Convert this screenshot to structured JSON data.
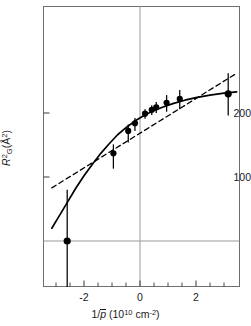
{
  "chart_data": {
    "type": "scatter",
    "title": "",
    "xlabel": "1/p̄ (10¹⁰ cm⁻²)",
    "ylabel": "R²G(Å²)",
    "xlim": [
      -3.2,
      3.5
    ],
    "ylim": [
      -40,
      300
    ],
    "grid": false,
    "zero_lines": {
      "vertical_x": 0,
      "horizontal_y": 0
    },
    "xticks_major": [
      -2,
      0,
      2
    ],
    "xticks_minor": [
      -3,
      -2.5,
      -1.5,
      -1,
      -0.5,
      0.5,
      1,
      1.5,
      2.5,
      3
    ],
    "xtick_labels": [
      "-2",
      "0",
      "2"
    ],
    "yticks": [
      100,
      200
    ],
    "ytick_labels": [
      "100",
      "200"
    ],
    "points": [
      {
        "x": -2.6,
        "y": 0,
        "yerr_low": 72,
        "yerr_high": 80
      },
      {
        "x": -0.95,
        "y": 137,
        "yerr_low": 24,
        "yerr_high": 14
      },
      {
        "x": -0.42,
        "y": 172,
        "yerr_low": 18,
        "yerr_high": 10
      },
      {
        "x": -0.18,
        "y": 184,
        "yerr_low": 12,
        "yerr_high": 8
      },
      {
        "x": 0.18,
        "y": 199,
        "yerr_low": 8,
        "yerr_high": 7
      },
      {
        "x": 0.42,
        "y": 205,
        "yerr_low": 8,
        "yerr_high": 7
      },
      {
        "x": 0.58,
        "y": 209,
        "yerr_low": 9,
        "yerr_high": 8
      },
      {
        "x": 0.95,
        "y": 216,
        "yerr_low": 14,
        "yerr_high": 12
      },
      {
        "x": 1.42,
        "y": 222,
        "yerr_low": 16,
        "yerr_high": 14
      },
      {
        "x": 3.15,
        "y": 230,
        "yerr_low": 34,
        "yerr_high": 32
      }
    ],
    "series": [
      {
        "name": "solid-fit-curve",
        "style": "solid",
        "points": [
          [
            -3.15,
            20
          ],
          [
            -2.9,
            38
          ],
          [
            -2.6,
            60
          ],
          [
            -2.3,
            82
          ],
          [
            -2.0,
            102
          ],
          [
            -1.7,
            120
          ],
          [
            -1.4,
            137
          ],
          [
            -1.1,
            152
          ],
          [
            -0.8,
            166
          ],
          [
            -0.5,
            177
          ],
          [
            -0.2,
            187
          ],
          [
            0.1,
            195
          ],
          [
            0.4,
            202
          ],
          [
            0.8,
            209
          ],
          [
            1.2,
            215
          ],
          [
            1.6,
            220
          ],
          [
            2.0,
            224
          ],
          [
            2.5,
            228
          ],
          [
            3.0,
            231
          ],
          [
            3.45,
            233
          ]
        ]
      },
      {
        "name": "dashed-linear-fit",
        "style": "dashed",
        "points": [
          [
            -3.15,
            83
          ],
          [
            3.45,
            262
          ]
        ]
      }
    ]
  },
  "axes": {
    "y_label_main": "R",
    "y_label_sub": "G",
    "y_label_sup": "2",
    "y_label_unit_open": "(",
    "y_label_unit": "Å",
    "y_label_unit_sup": "2",
    "y_label_unit_close": ")",
    "x_label_num": "1/",
    "x_label_var": "p",
    "x_label_paren_open": "(10",
    "x_label_exp": "10",
    "x_label_unit": "cm",
    "x_label_unit_exp": "-2",
    "x_label_paren_close": ")"
  }
}
